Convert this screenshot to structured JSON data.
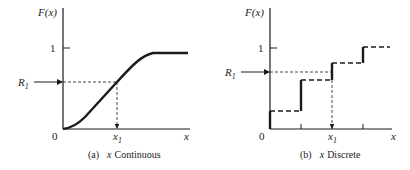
{
  "panel_a": {
    "y_label": "F(x)",
    "tick_one": "1",
    "r_label": "R",
    "r_sub": "1",
    "origin": "0",
    "x1_label": "x",
    "x1_sub": "1",
    "x_label": "x",
    "caption_prefix": "(a)",
    "caption_var": "x",
    "caption_text": "Continuous"
  },
  "panel_b": {
    "y_label": "F(x)",
    "tick_one": "1",
    "r_label": "R",
    "r_sub": "1",
    "origin": "0",
    "x1_label": "x",
    "x1_sub": "1",
    "x_label": "x",
    "caption_prefix": "(b)",
    "caption_var": "x",
    "caption_text": "Discrete"
  },
  "colors": {
    "ink": "#1a1a1a"
  }
}
